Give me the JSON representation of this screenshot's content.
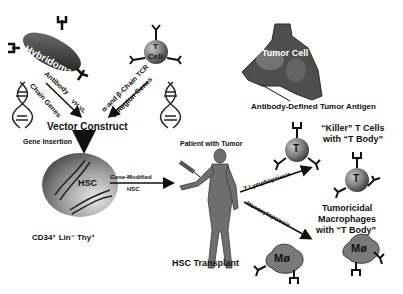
{
  "labels": {
    "hybridoma": "Hybridoma",
    "t_cell_top": "T",
    "t_cell_bottom": "Cell",
    "antibody": "Antibody",
    "vh_vl": "VH VL",
    "chain_genes": "Chain Genes",
    "tcr": "α-and β-Chain TCR",
    "c_region": "C-Region Genes",
    "vector_construct": "Vector Construct",
    "gene_insertion": "Gene Insertion",
    "hsc": "HSC",
    "gene_modified": "Gene-Modified",
    "gene_modified_hsc": "HSC",
    "cd34": "CD34⁺  Lin⁻ Thy⁺",
    "patient": "Patient with Tumor",
    "hsc_transplant": "HSC Transplant",
    "tumor_cell": "Tumor Cell",
    "tumor_antigen": "Antibody-Defined Tumor Antigen",
    "killer_line1": "“Killer” T Cells",
    "killer_line2": "with “T Body”",
    "t_lymphopoiesis": "T Lymphopoiesis",
    "monocytopoiesis": "Monocytopoiesis",
    "macro_line1": "Tumoricidal",
    "macro_line2": "Macrophages",
    "macro_line3": "with “T Body”",
    "t_glyph": "T",
    "mo_glyph": "Mø"
  }
}
